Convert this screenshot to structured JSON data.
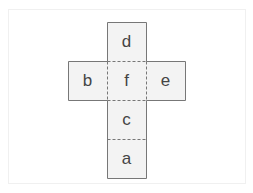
{
  "diagram": {
    "type": "cube-net",
    "colors": {
      "face_fill": "#f3f3f3",
      "outline": "#777777",
      "fold_line": "#777777",
      "label": "#444444"
    },
    "faces": [
      {
        "id": "d",
        "label": "d",
        "row": 0,
        "col": 1
      },
      {
        "id": "b",
        "label": "b",
        "row": 1,
        "col": 0
      },
      {
        "id": "f",
        "label": "f",
        "row": 1,
        "col": 1
      },
      {
        "id": "e",
        "label": "e",
        "row": 1,
        "col": 2
      },
      {
        "id": "c",
        "label": "c",
        "row": 2,
        "col": 1
      },
      {
        "id": "a",
        "label": "a",
        "row": 3,
        "col": 1
      }
    ],
    "fold_lines": [
      "d-f",
      "b-f",
      "f-e",
      "f-c",
      "c-a"
    ]
  }
}
